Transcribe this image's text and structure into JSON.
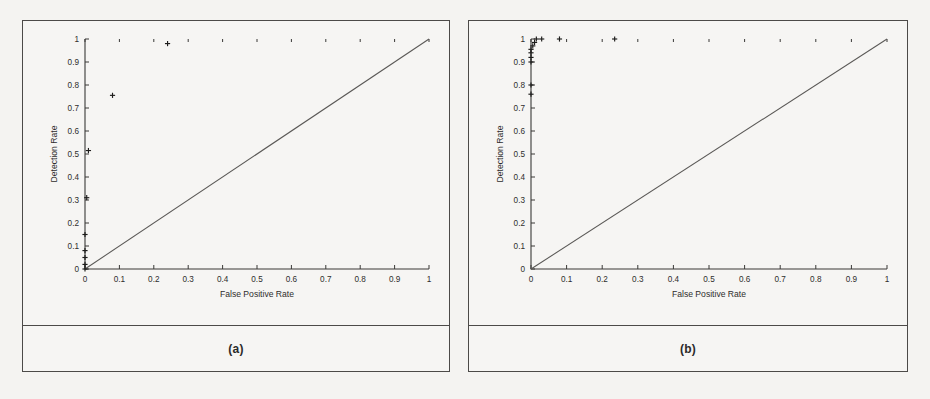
{
  "figure": {
    "background_color": "#f4f3f1",
    "frame_color": "#4c4a48",
    "panels": [
      {
        "id": "a",
        "caption": "(a)"
      },
      {
        "id": "b",
        "caption": "(b)"
      }
    ]
  },
  "chart_data": [
    {
      "type": "scatter",
      "panel": "a",
      "title": "",
      "caption": "(a)",
      "xlabel": "False Positive Rate",
      "ylabel": "Detection Rate",
      "xlim": [
        0,
        1
      ],
      "ylim": [
        0,
        1
      ],
      "grid": false,
      "legend": "none",
      "xticks": [
        0,
        0.1,
        0.2,
        0.3,
        0.4,
        0.5,
        0.6,
        0.7,
        0.8,
        0.9,
        1
      ],
      "yticks": [
        0,
        0.1,
        0.2,
        0.3,
        0.4,
        0.5,
        0.6,
        0.7,
        0.8,
        0.9,
        1
      ],
      "xticklabels": [
        "0",
        "0.1",
        "0.2",
        "0.3",
        "0.4",
        "0.5",
        "0.6",
        "0.7",
        "0.8",
        "0.9",
        "1"
      ],
      "yticklabels": [
        "0",
        "0.1",
        "0.2",
        "0.3",
        "0.4",
        "0.5",
        "0.6",
        "0.7",
        "0.8",
        "0.9",
        "1"
      ],
      "marker_style": "plus",
      "series": [
        {
          "name": "ROC operating points",
          "points": [
            [
              0.0,
              0.0
            ],
            [
              0.0,
              0.02
            ],
            [
              0.0,
              0.05
            ],
            [
              0.0,
              0.08
            ],
            [
              0.0,
              0.15
            ],
            [
              0.005,
              0.31
            ],
            [
              0.01,
              0.515
            ],
            [
              0.08,
              0.755
            ],
            [
              0.24,
              0.98
            ]
          ]
        }
      ],
      "reference_line": {
        "name": "chance diagonal",
        "from": [
          0,
          0
        ],
        "to": [
          1,
          1
        ]
      }
    },
    {
      "type": "scatter",
      "panel": "b",
      "title": "",
      "caption": "(b)",
      "xlabel": "False Positive Rate",
      "ylabel": "Detection Rate",
      "xlim": [
        0,
        1
      ],
      "ylim": [
        0,
        1
      ],
      "grid": false,
      "legend": "none",
      "xticks": [
        0,
        0.1,
        0.2,
        0.3,
        0.4,
        0.5,
        0.6,
        0.7,
        0.8,
        0.9,
        1
      ],
      "yticks": [
        0,
        0.1,
        0.2,
        0.3,
        0.4,
        0.5,
        0.6,
        0.7,
        0.8,
        0.9,
        1
      ],
      "xticklabels": [
        "0",
        "0.1",
        "0.2",
        "0.3",
        "0.4",
        "0.5",
        "0.6",
        "0.7",
        "0.8",
        "0.9",
        "1"
      ],
      "yticklabels": [
        "0",
        "0.1",
        "0.2",
        "0.3",
        "0.4",
        "0.5",
        "0.6",
        "0.7",
        "0.8",
        "0.9",
        "1"
      ],
      "marker_style": "plus",
      "series": [
        {
          "name": "ROC operating points",
          "points": [
            [
              0.0,
              0.76
            ],
            [
              0.0,
              0.8
            ],
            [
              0.0,
              0.9
            ],
            [
              0.0,
              0.92
            ],
            [
              0.0,
              0.94
            ],
            [
              0.0,
              0.955
            ],
            [
              0.005,
              0.97
            ],
            [
              0.01,
              0.985
            ],
            [
              0.015,
              1.0
            ],
            [
              0.03,
              1.0
            ],
            [
              0.08,
              1.0
            ],
            [
              0.235,
              1.0
            ]
          ]
        }
      ],
      "reference_line": {
        "name": "chance diagonal",
        "from": [
          0,
          0
        ],
        "to": [
          1,
          1
        ]
      }
    }
  ]
}
